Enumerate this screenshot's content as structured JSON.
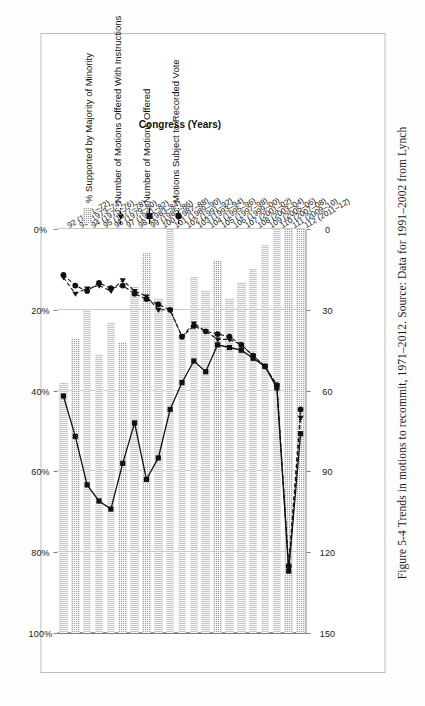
{
  "figure": {
    "caption": "Figure 5-4 Trends in motions to recommit, 1971–2012. Source: Data for 1991–2002 from Lynch"
  },
  "axes": {
    "category_axis_title": "Congress (Years)",
    "percent_axis_ticks": [
      "0%",
      "20%",
      "40%",
      "60%",
      "80%",
      "100%"
    ],
    "count_axis_ticks": [
      "0",
      "30",
      "60",
      "90",
      "120",
      "150"
    ]
  },
  "legend": {
    "items": [
      {
        "label": "% Supported by Majority of Minority",
        "marker": "hatched-bar-swatch"
      },
      {
        "label": "Number of Motions Offered With Instructions",
        "marker": "dashed-line-triangle-marker"
      },
      {
        "label": "Number of Motions Offered",
        "marker": "solid-line-square-marker"
      },
      {
        "label": "Motions Subject to Recorded Vote",
        "marker": "dashed-line-circle-marker"
      }
    ]
  },
  "chart_data": {
    "type": "bar",
    "title": "Trends in motions to recommit, 1971–2012",
    "xlabel": "Congress (Years)",
    "ylabel": "",
    "grid": true,
    "legend_position": "right",
    "categories": [
      "92 (1971–72)",
      "93 (1973–74)",
      "94 (1975–76)",
      "95 (1977–78)",
      "96 (1979–80)",
      "97 (1981–82)",
      "98 (1983–84)",
      "99 (1985–86)",
      "100 (1987–88)",
      "101 (1989–90)",
      "102 (1991–92)",
      "103 (1993–94)",
      "104 (1995–96)",
      "105 (1997–98)",
      "106 (1999–00)",
      "107 (2001–02)",
      "108 (2003–04)",
      "109 (2005–06)",
      "110 (2007–08)",
      "111 (2009–10)",
      "112 (2011–12)"
    ],
    "bar_series": {
      "name": "% Supported by Majority of Minority",
      "axis": "percent",
      "ylim": [
        0,
        100
      ],
      "unit": "%",
      "values": [
        62,
        73,
        80,
        69,
        77,
        72,
        86,
        94,
        83,
        100,
        74,
        88,
        85,
        92,
        83,
        87,
        90,
        96,
        100,
        100,
        100
      ]
    },
    "line_series": [
      {
        "name": "Number of Motions Offered",
        "axis": "count",
        "ylim": [
          0,
          150
        ],
        "marker": "square",
        "line": "solid",
        "values": [
          62,
          77,
          95,
          101,
          104,
          87,
          72,
          93,
          85,
          67,
          57,
          49,
          53,
          43,
          44,
          45,
          48,
          51,
          59,
          127,
          76
        ]
      },
      {
        "name": "Number of Motions Offered With Instructions",
        "axis": "count",
        "ylim": [
          0,
          150
        ],
        "marker": "triangle",
        "line": "dashed",
        "values": [
          18,
          24,
          22,
          21,
          23,
          19,
          23,
          25,
          30,
          30,
          40,
          35,
          38,
          41,
          41,
          43,
          47,
          51,
          58,
          126,
          70
        ]
      },
      {
        "name": "Motions Subject to Recorded Vote",
        "axis": "count",
        "ylim": [
          0,
          150
        ],
        "marker": "circle",
        "line": "dashed",
        "values": [
          17,
          21,
          23,
          20,
          22,
          21,
          24,
          26,
          28,
          30,
          40,
          36,
          38,
          39,
          40,
          43,
          47,
          51,
          58,
          125,
          67
        ]
      }
    ]
  }
}
